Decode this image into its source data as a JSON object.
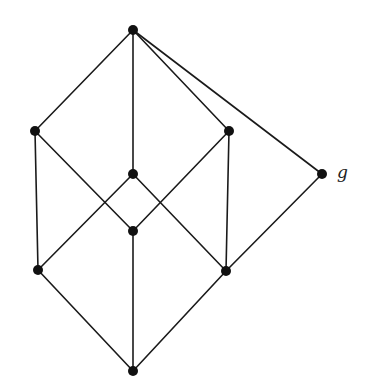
{
  "diagram": {
    "type": "hasse-diagram",
    "width": 365,
    "height": 389,
    "colors": {
      "edge": "#1a1a1a",
      "node": "#111111",
      "background": "#ffffff"
    },
    "node_radius": 5,
    "nodes": [
      {
        "id": "top",
        "x": 133,
        "y": 30,
        "label": ""
      },
      {
        "id": "upper-left",
        "x": 35,
        "y": 131,
        "label": ""
      },
      {
        "id": "upper-right",
        "x": 229,
        "y": 131,
        "label": ""
      },
      {
        "id": "center-upper",
        "x": 133,
        "y": 174,
        "label": ""
      },
      {
        "id": "g",
        "x": 322,
        "y": 174,
        "label": "g"
      },
      {
        "id": "center-lower",
        "x": 133,
        "y": 231,
        "label": ""
      },
      {
        "id": "lower-left",
        "x": 38,
        "y": 270,
        "label": ""
      },
      {
        "id": "lower-right",
        "x": 226,
        "y": 271,
        "label": ""
      },
      {
        "id": "bottom",
        "x": 133,
        "y": 371,
        "label": ""
      }
    ],
    "edges": [
      [
        "top",
        "upper-left"
      ],
      [
        "top",
        "center-upper"
      ],
      [
        "top",
        "upper-right"
      ],
      [
        "top",
        "g"
      ],
      [
        "upper-left",
        "lower-left"
      ],
      [
        "upper-left",
        "center-lower"
      ],
      [
        "upper-right",
        "lower-right"
      ],
      [
        "upper-right",
        "center-lower"
      ],
      [
        "center-upper",
        "lower-left"
      ],
      [
        "center-upper",
        "lower-right"
      ],
      [
        "g",
        "lower-right"
      ],
      [
        "center-lower",
        "bottom"
      ],
      [
        "lower-left",
        "bottom"
      ],
      [
        "lower-right",
        "bottom"
      ]
    ],
    "labels": [
      {
        "text": "g",
        "x": 337,
        "y": 178,
        "for": "g"
      }
    ]
  }
}
